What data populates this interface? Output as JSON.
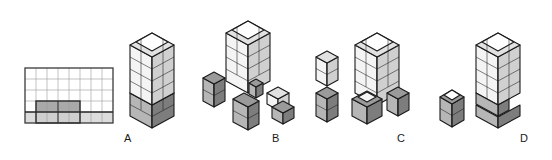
{
  "figure": {
    "background_color": "#ffffff",
    "outline_color": "#1a1a1a",
    "colors": {
      "white_face": "#ffffff",
      "light_top": "#e2e2e2",
      "light_left": "#f2f2f2",
      "light_right": "#d2d2d2",
      "dark_top": "#9a9a9a",
      "dark_left": "#b5b5b5",
      "dark_right": "#7e7e7e",
      "grid_line": "#8c8c8c",
      "grid_border": "#3c3c3c",
      "grid_light_cell": "#dcdcdc",
      "grid_dark_cell": "#a9a9a9"
    }
  },
  "grid_key": {
    "name": "2d-grid-key",
    "columns": 8,
    "rows": 5,
    "x": 25,
    "y": 68,
    "cell_width": 11,
    "cell_height": 11,
    "shaded_cells": [
      {
        "row": 4,
        "col": 1,
        "shade": "dark"
      },
      {
        "row": 4,
        "col": 2,
        "shade": "dark"
      },
      {
        "row": 4,
        "col": 3,
        "shade": "dark"
      },
      {
        "row": 4,
        "col": 4,
        "shade": "dark"
      },
      {
        "row": 5,
        "col": 1,
        "shade": "light"
      },
      {
        "row": 5,
        "col": 2,
        "shade": "light"
      },
      {
        "row": 5,
        "col": 3,
        "shade": "light"
      },
      {
        "row": 5,
        "col": 4,
        "shade": "light"
      },
      {
        "row": 5,
        "col": 5,
        "shade": "light"
      },
      {
        "row": 5,
        "col": 6,
        "shade": "light"
      },
      {
        "row": 5,
        "col": 7,
        "shade": "light"
      },
      {
        "row": 5,
        "col": 8,
        "shade": "light"
      },
      {
        "row": 5,
        "col": 0,
        "shade": "light"
      }
    ]
  },
  "options": [
    {
      "id": "A",
      "label": "A",
      "label_x": 124,
      "label_y": 139,
      "description": "Single assembled tower: four light tiers above two dark tiers",
      "pieces": 1
    },
    {
      "id": "B",
      "label": "B",
      "label_x": 272,
      "label_y": 139,
      "description": "Tall light tower with four separated dark corner pieces exploded beneath",
      "pieces": 5
    },
    {
      "id": "C",
      "label": "C",
      "label_x": 397,
      "label_y": 139,
      "description": "Light tower with dark base, plus two detached V-shaped corner pieces at left",
      "pieces": 4
    },
    {
      "id": "D",
      "label": "D",
      "label_x": 520,
      "label_y": 139,
      "description": "Light tower with dark base, plus one small detached dark block at left",
      "pieces": 2
    }
  ]
}
